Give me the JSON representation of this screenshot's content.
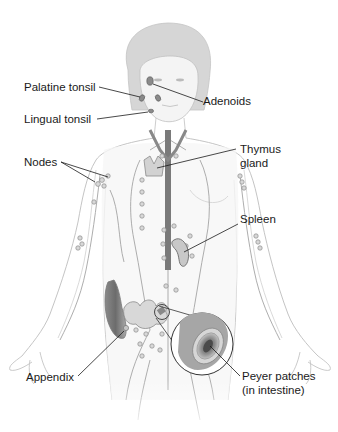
{
  "diagram": {
    "labels": {
      "palatine_tonsil": "Palatine tonsil",
      "adenoids": "Adenoids",
      "lingual_tonsil": "Lingual tonsil",
      "nodes": "Nodes",
      "thymus_line1": "Thymus",
      "thymus_line2": "gland",
      "spleen": "Spleen",
      "appendix": "Appendix",
      "peyer_line1": "Peyer patches",
      "peyer_line2": "(in intestine)"
    },
    "colors": {
      "background": "#ffffff",
      "body_outline": "#b8b8b8",
      "body_fill": "#f2f2f2",
      "hair": "#d4d4d4",
      "vessel": "#9a9a9a",
      "organ": "#c8c8c8",
      "organ_dark": "#7a7a7a",
      "leader_line": "#1a1a1a",
      "text": "#1a1a1a"
    }
  }
}
